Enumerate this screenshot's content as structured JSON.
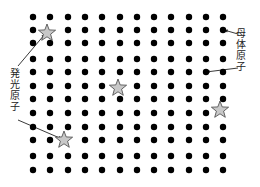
{
  "diagram": {
    "grid": {
      "columns": 12,
      "rows": 12,
      "x_positions": [
        33,
        50,
        68,
        85,
        102,
        120,
        137,
        154,
        171,
        189,
        206,
        223
      ],
      "y_positions": [
        17,
        30,
        43,
        59,
        72,
        86,
        99,
        113,
        127,
        140,
        156,
        170
      ],
      "dot_radius": 3.2,
      "dot_color": "#000000"
    },
    "stars": [
      {
        "x": 47,
        "y": 33
      },
      {
        "x": 118,
        "y": 88
      },
      {
        "x": 220,
        "y": 110
      },
      {
        "x": 64,
        "y": 140
      }
    ],
    "star_fill": "#c8c8c8",
    "star_stroke": "#444444",
    "labels": {
      "host_atom": "母体原子",
      "emitting_atom": "発光原子"
    },
    "arrows": [
      {
        "from": [
          238,
          34
        ],
        "to": [
          224,
          30
        ],
        "label": "host_atom"
      },
      {
        "from": [
          238,
          68
        ],
        "to": [
          206,
          72
        ],
        "label": "host_atom"
      },
      {
        "from": [
          18,
          66
        ],
        "to": [
          45,
          34
        ],
        "label": "emitting_atom"
      },
      {
        "from": [
          18,
          120
        ],
        "to": [
          62,
          139
        ],
        "label": "emitting_atom"
      }
    ]
  }
}
